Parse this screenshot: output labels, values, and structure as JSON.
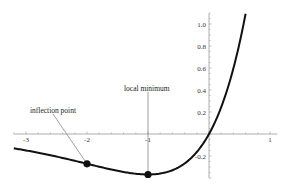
{
  "chart_data": {
    "type": "line",
    "title": "",
    "xlabel": "",
    "ylabel": "",
    "function": "x*exp(x)",
    "xlim": [
      -3.2,
      1.1
    ],
    "ylim": [
      -0.4,
      1.1
    ],
    "grid": false,
    "x_ticks": [
      -3,
      -2,
      -1,
      1
    ],
    "x_tick_labels": [
      "-3",
      "-2",
      "-1",
      "1"
    ],
    "y_ticks": [
      -0.2,
      0.2,
      0.4,
      0.6,
      0.8,
      1.0
    ],
    "y_tick_labels": [
      "-0.2",
      "0.2",
      "0.4",
      "0.6",
      "0.8",
      "1.0"
    ],
    "series": [
      {
        "name": "f(x)",
        "x": [
          -3.0,
          -2.5,
          -2.0,
          -1.5,
          -1.0,
          -0.5,
          0.0,
          0.25,
          0.5,
          0.6
        ],
        "values": [
          -0.149,
          -0.205,
          -0.271,
          -0.335,
          -0.368,
          -0.303,
          0.0,
          0.321,
          0.824,
          1.093
        ]
      }
    ],
    "points": [
      {
        "x": -2,
        "y": -0.271,
        "label": "inflection point"
      },
      {
        "x": -1,
        "y": -0.368,
        "label": "local minimum"
      }
    ],
    "annotations": [
      {
        "text": "inflection point",
        "x": -2,
        "y": -0.271
      },
      {
        "text": "local minimum",
        "x": -1,
        "y": -0.368
      }
    ]
  }
}
